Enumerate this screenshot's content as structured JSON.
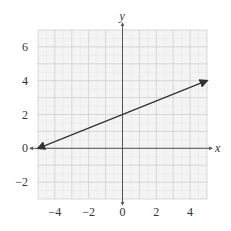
{
  "chart_data": {
    "type": "line",
    "title": "",
    "xlabel": "x",
    "ylabel": "y",
    "xlim": [
      -5,
      5
    ],
    "ylim": [
      -3,
      7
    ],
    "grid": true,
    "x_ticks": [
      -4,
      -2,
      0,
      2,
      4
    ],
    "y_ticks": [
      -2,
      0,
      2,
      4,
      6
    ],
    "x_tick_labels": [
      "−4",
      "−2",
      "0",
      "2",
      "4"
    ],
    "y_tick_labels": [
      "−2",
      "0",
      "2",
      "4",
      "6"
    ],
    "series": [
      {
        "name": "line",
        "x": [
          -5,
          5
        ],
        "y": [
          0,
          4
        ],
        "arrows": "both",
        "color": "#333333"
      }
    ]
  },
  "colors": {
    "grid_minor": "#e4e4e4",
    "grid_major": "#cfcfcf",
    "grid_bg": "#f4f4f4",
    "axis": "#555555",
    "line": "#333333"
  }
}
